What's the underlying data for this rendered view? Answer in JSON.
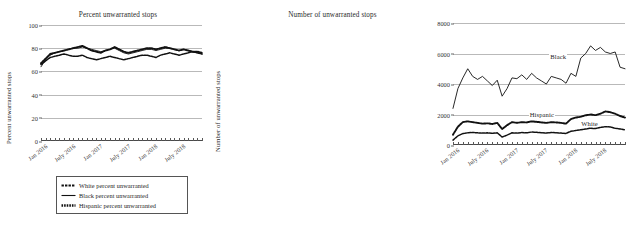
{
  "caption": "",
  "legend": {
    "items": [
      {
        "label": "White percent unwarranted",
        "mark": "dashed-line-marker"
      },
      {
        "label": "Black percent unwarranted",
        "mark": "solid-line-marker"
      },
      {
        "label": "Hispanic percent unwarranted",
        "mark": "dotted-thick-line-marker"
      }
    ]
  },
  "chart_data": [
    {
      "type": "line",
      "title": "Percent unwarranted stops",
      "xlabel": "",
      "ylabel": "Percent unwarranted stops",
      "ylim": [
        0,
        100
      ],
      "yticks": [
        0,
        20,
        40,
        60,
        80,
        100
      ],
      "grid": true,
      "legend_position": "below",
      "x": [
        "Jan 2016",
        "Feb 2016",
        "Mar 2016",
        "Apr 2016",
        "May 2016",
        "Jun 2016",
        "Jul 2016",
        "Aug 2016",
        "Sep 2016",
        "Oct 2016",
        "Nov 2016",
        "Dec 2016",
        "Jan 2017",
        "Feb 2017",
        "Mar 2017",
        "Apr 2017",
        "May 2017",
        "Jun 2017",
        "Jul 2017",
        "Aug 2017",
        "Sep 2017",
        "Oct 2017",
        "Nov 2017",
        "Dec 2017",
        "Jan 2018",
        "Feb 2018",
        "Mar 2018",
        "Apr 2018",
        "May 2018",
        "Jun 2018",
        "Jul 2018",
        "Aug 2018",
        "Sep 2018",
        "Oct 2018",
        "Nov 2018",
        "Dec 2018"
      ],
      "xtick_labels": [
        "Jan 2016",
        "July 2016",
        "Jan 2017",
        "July 2017",
        "Jan 2018",
        "July 2018"
      ],
      "xtick_positions": [
        0,
        6,
        12,
        18,
        24,
        30
      ],
      "series": [
        {
          "name": "White percent unwarranted",
          "style": "dashed",
          "values": [
            66,
            69,
            72,
            73,
            74,
            75,
            74,
            73,
            73,
            74,
            72,
            71,
            70,
            71,
            72,
            73,
            72,
            71,
            70,
            71,
            72,
            73,
            74,
            74,
            73,
            72,
            74,
            75,
            76,
            75,
            74,
            75,
            76,
            77,
            76,
            75
          ]
        },
        {
          "name": "Black percent unwarranted",
          "style": "solid",
          "values": [
            64,
            70,
            74,
            76,
            77,
            78,
            79,
            80,
            80,
            81,
            80,
            79,
            78,
            77,
            78,
            79,
            80,
            78,
            76,
            75,
            76,
            77,
            78,
            79,
            79,
            78,
            79,
            80,
            80,
            79,
            78,
            79,
            78,
            77,
            76,
            75
          ]
        },
        {
          "name": "Hispanic percent unwarranted",
          "style": "dotted",
          "values": [
            67,
            71,
            75,
            76,
            77,
            78,
            79,
            80,
            81,
            82,
            80,
            78,
            77,
            76,
            78,
            79,
            81,
            79,
            77,
            76,
            77,
            78,
            79,
            80,
            80,
            79,
            80,
            81,
            80,
            79,
            78,
            79,
            78,
            77,
            77,
            76
          ]
        }
      ]
    },
    {
      "type": "line",
      "title": "Number of unwarranted stops",
      "xlabel": "",
      "ylabel": "Number of unwarranted stops",
      "ylim": [
        0,
        8000
      ],
      "yticks": [
        0,
        2000,
        4000,
        6000,
        8000
      ],
      "grid": true,
      "legend_position": "inline-annotations",
      "annotations": [
        {
          "text": "Black",
          "value": 5600
        },
        {
          "text": "Hispanic",
          "value": 2000
        },
        {
          "text": "White",
          "value": 1400
        }
      ],
      "x": [
        "Jan 2016",
        "Feb 2016",
        "Mar 2016",
        "Apr 2016",
        "May 2016",
        "Jun 2016",
        "Jul 2016",
        "Aug 2016",
        "Sep 2016",
        "Oct 2016",
        "Nov 2016",
        "Dec 2016",
        "Jan 2017",
        "Feb 2017",
        "Mar 2017",
        "Apr 2017",
        "May 2017",
        "Jun 2017",
        "Jul 2017",
        "Aug 2017",
        "Sep 2017",
        "Oct 2017",
        "Nov 2017",
        "Dec 2017",
        "Jan 2018",
        "Feb 2018",
        "Mar 2018",
        "Apr 2018",
        "May 2018",
        "Jun 2018",
        "Jul 2018",
        "Aug 2018",
        "Sep 2018",
        "Oct 2018",
        "Nov 2018",
        "Dec 2018"
      ],
      "xtick_labels": [
        "Jan 2016",
        "July 2016",
        "Jan 2017",
        "July 2017",
        "Jan 2018",
        "July 2018"
      ],
      "xtick_positions": [
        0,
        6,
        12,
        18,
        24,
        30
      ],
      "series": [
        {
          "name": "Black",
          "style": "solid",
          "values": [
            2400,
            3700,
            4400,
            5000,
            4500,
            4300,
            4500,
            4200,
            3900,
            4250,
            3200,
            3700,
            4400,
            4350,
            4600,
            4300,
            4700,
            4400,
            4200,
            4000,
            4500,
            4400,
            4300,
            4050,
            4700,
            4500,
            5700,
            6000,
            6500,
            6200,
            6400,
            6100,
            6000,
            6100,
            5100,
            5000
          ]
        },
        {
          "name": "Hispanic",
          "style": "dotted",
          "values": [
            680,
            1200,
            1500,
            1550,
            1500,
            1450,
            1400,
            1420,
            1380,
            1450,
            1050,
            1300,
            1500,
            1450,
            1500,
            1480,
            1550,
            1520,
            1480,
            1450,
            1500,
            1480,
            1450,
            1400,
            1700,
            1800,
            1850,
            1950,
            2000,
            1950,
            2050,
            2200,
            2150,
            2050,
            1900,
            1800
          ]
        },
        {
          "name": "White",
          "style": "dashed",
          "values": [
            320,
            600,
            750,
            800,
            820,
            800,
            780,
            800,
            760,
            800,
            520,
            650,
            800,
            780,
            820,
            800,
            850,
            830,
            800,
            780,
            820,
            800,
            780,
            760,
            900,
            950,
            1000,
            1050,
            1100,
            1080,
            1150,
            1200,
            1180,
            1100,
            1050,
            1000
          ]
        }
      ]
    }
  ]
}
